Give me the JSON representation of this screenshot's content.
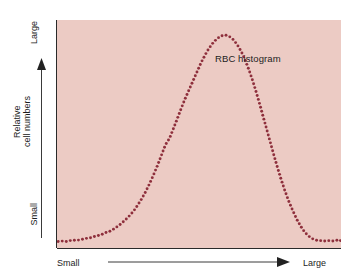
{
  "figure": {
    "background_color": "#ffffff",
    "panel_color": "#eccbc4",
    "dot_color": "#8e2f3c",
    "axis_color": "#2a2a2a"
  },
  "plot": {
    "annotation_label": "RBC histogram"
  },
  "y_axis": {
    "title_line1": "Relative",
    "title_line2": "cell numbers",
    "title": "Relative\ncell numbers",
    "tick_top": "Large",
    "tick_bottom": "Small",
    "arrow_direction": "up"
  },
  "x_axis": {
    "tick_left": "Small",
    "tick_right": "Large",
    "arrow_direction": "right"
  },
  "chart_data": {
    "type": "line",
    "title": "RBC histogram",
    "xlabel": "Cell size (Small → Large)",
    "ylabel": "Relative cell numbers (Small → Large)",
    "xlim": [
      0,
      100
    ],
    "ylim": [
      0,
      100
    ],
    "grid": false,
    "legend": "none",
    "marker": "dotted",
    "marker_color": "#8e2f3c",
    "annotations": [
      {
        "text": "RBC histogram",
        "x": 56,
        "y": 86
      }
    ],
    "series": [
      {
        "name": "RBC size distribution",
        "x": [
          0.4,
          1.8,
          3.2,
          4.6,
          6.0,
          7.4,
          8.8,
          10.2,
          11.6,
          13.0,
          14.4,
          15.8,
          17.2,
          18.6,
          20.0,
          21.4,
          22.8,
          24.2,
          25.6,
          27.0,
          28.4,
          29.8,
          31.2,
          32.6,
          34.0,
          35.4,
          36.8,
          38.2,
          39.6,
          41.0,
          42.4,
          43.8,
          45.2,
          46.6,
          48.0,
          49.4,
          50.8,
          52.2,
          53.6,
          55.0,
          56.4,
          57.8,
          59.2,
          60.6,
          62.0,
          63.4,
          64.8,
          66.2,
          67.6,
          69.0,
          70.4,
          71.8,
          73.2,
          74.6,
          76.0,
          77.4,
          78.8,
          80.2,
          81.6,
          83.0,
          84.4,
          85.8,
          87.2,
          88.6,
          90.0,
          91.4,
          92.8,
          94.2,
          95.6,
          97.0,
          98.4,
          99.8
        ],
        "y": [
          2.0,
          2.2,
          2.0,
          2.4,
          2.6,
          2.6,
          3.0,
          3.4,
          3.6,
          4.2,
          4.6,
          5.2,
          6.0,
          6.6,
          7.6,
          8.8,
          10.2,
          11.8,
          13.6,
          15.6,
          18.2,
          21.0,
          24.2,
          27.8,
          31.8,
          36.0,
          40.6,
          45.2,
          48.0,
          52.4,
          57.0,
          61.6,
          66.0,
          70.0,
          74.0,
          78.0,
          82.0,
          85.4,
          88.4,
          90.8,
          92.6,
          93.8,
          94.2,
          93.6,
          92.2,
          90.0,
          87.0,
          83.2,
          78.6,
          73.4,
          67.6,
          61.4,
          55.0,
          48.6,
          42.2,
          36.0,
          30.2,
          24.8,
          20.0,
          15.8,
          12.0,
          8.8,
          6.2,
          4.4,
          3.2,
          2.6,
          2.4,
          2.2,
          2.4,
          2.2,
          2.6,
          2.4
        ]
      }
    ]
  }
}
